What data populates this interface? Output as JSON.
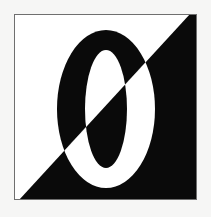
{
  "canvas": {
    "width": 211,
    "height": 217,
    "background_color": "#f6f6f5",
    "description": "Black-and-white graphic mark: a square panel split by a diagonal, with a large numeral zero rendered in inverted colors"
  },
  "artwork": {
    "title": "Inverted Diagonal Zero",
    "frame": {
      "x": 14,
      "y": 14,
      "width": 183,
      "height": 186,
      "border_color": "#6f6f6f",
      "border_width": 1
    },
    "panel": {
      "light_color": "#ffffff",
      "dark_color": "#0a0a0a",
      "split": "diagonal",
      "diagonal_from": "top-right",
      "diagonal_to": "bottom-left",
      "upper_left_region": "white",
      "lower_right_region": "black"
    },
    "glyph": {
      "character": "0",
      "name": "numeral-zero",
      "style": "serif-oval",
      "outer_left": 57,
      "outer_right": 155,
      "outer_top": 30,
      "outer_bottom": 188,
      "counter_left": 86,
      "counter_right": 128,
      "counter_top": 50,
      "counter_bottom": 168,
      "fill_on_white": "#0a0a0a",
      "fill_on_black": "#ffffff"
    }
  }
}
